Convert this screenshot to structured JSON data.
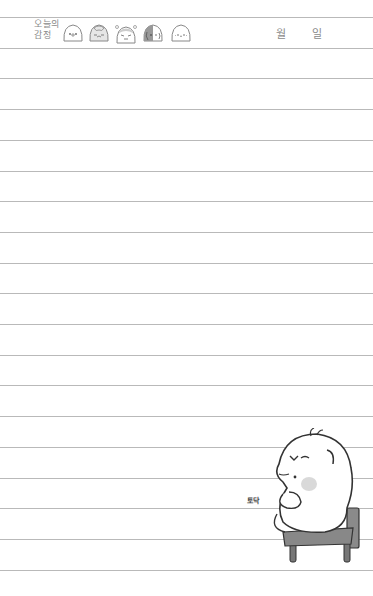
{
  "header": {
    "emotion_label_line1": "오늘의",
    "emotion_label_line2": "감정",
    "month_label": "월",
    "day_label": "일",
    "emotions": [
      {
        "name": "happy-face",
        "face": "'o'"
      },
      {
        "name": "sad-face",
        "face": ";ㅁ;"
      },
      {
        "name": "angry-face",
        "face": "ò_ó"
      },
      {
        "name": "gloomy-face",
        "face": ";_;"
      },
      {
        "name": "calm-face",
        "face": "·ᴗ·"
      }
    ]
  },
  "illustration": {
    "sound_text": "토닥",
    "description": "round white character sitting on a gray chair, patting itself"
  },
  "lines": {
    "count": 19,
    "first_y": 17,
    "spacing": 30.7,
    "color": "#b9b9b9"
  }
}
